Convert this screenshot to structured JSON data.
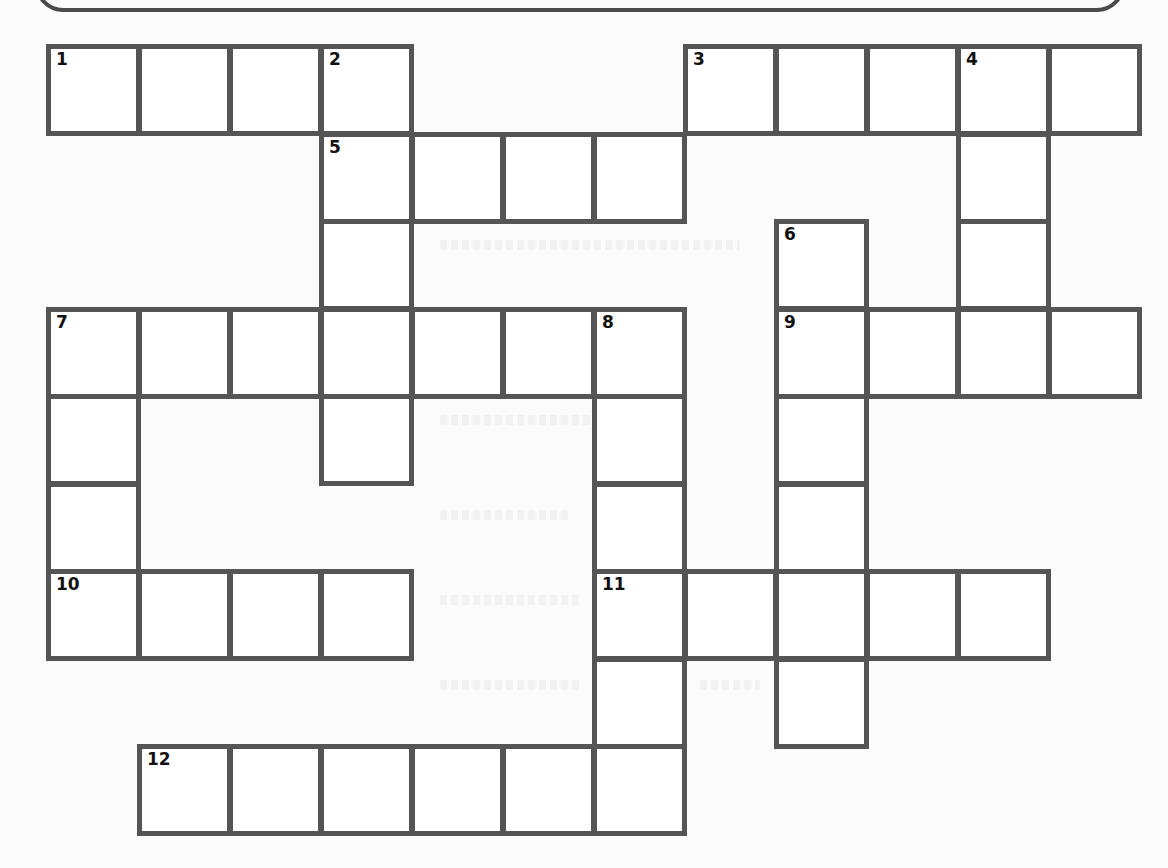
{
  "puzzle": {
    "type": "crossword",
    "grid_origin": {
      "x": 48,
      "y": 46
    },
    "cell_size": {
      "w": 91,
      "h": 87.5
    },
    "colors": {
      "border": "#555555",
      "cell": "#ffffff",
      "page": "#fbfbfb",
      "number": "#111111"
    },
    "clue_numbers": [
      "1",
      "2",
      "3",
      "4",
      "5",
      "6",
      "7",
      "8",
      "9",
      "10",
      "11",
      "12"
    ],
    "entries": [
      {
        "number": "1",
        "direction": "across",
        "row": 0,
        "col": 0,
        "length": 4
      },
      {
        "number": "2",
        "direction": "down",
        "row": 0,
        "col": 3,
        "length": 5
      },
      {
        "number": "3",
        "direction": "across",
        "row": 0,
        "col": 7,
        "length": 5
      },
      {
        "number": "4",
        "direction": "down",
        "row": 0,
        "col": 10,
        "length": 4
      },
      {
        "number": "5",
        "direction": "across",
        "row": 1,
        "col": 3,
        "length": 4
      },
      {
        "number": "6",
        "direction": "down",
        "row": 2,
        "col": 8,
        "length": 6
      },
      {
        "number": "7",
        "direction": "across",
        "row": 3,
        "col": 0,
        "length": 7
      },
      {
        "number": "7",
        "direction": "down",
        "row": 3,
        "col": 0,
        "length": 4
      },
      {
        "number": "8",
        "direction": "down",
        "row": 3,
        "col": 6,
        "length": 6
      },
      {
        "number": "9",
        "direction": "across",
        "row": 3,
        "col": 8,
        "length": 4
      },
      {
        "number": "10",
        "direction": "across",
        "row": 6,
        "col": 0,
        "length": 4
      },
      {
        "number": "11",
        "direction": "across",
        "row": 6,
        "col": 6,
        "length": 5
      },
      {
        "number": "12",
        "direction": "across",
        "row": 8,
        "col": 1,
        "length": 6
      }
    ]
  }
}
